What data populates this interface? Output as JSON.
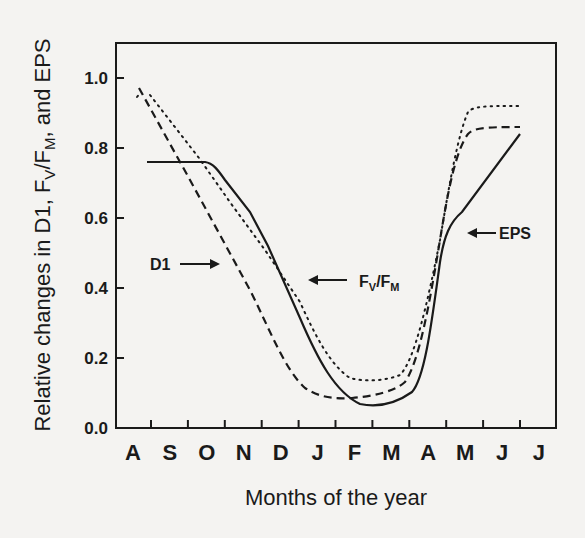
{
  "chart_data": {
    "type": "line",
    "title": "",
    "xlabel": "Months of the year",
    "ylabel": "Relative changes in D1, FV/FM, and EPS",
    "ylabel_parts": {
      "pre": "Relative changes in D1, F",
      "sub1": "V",
      "mid": "/F",
      "sub2": "M",
      "post": ", and EPS"
    },
    "x_categories": [
      "A",
      "S",
      "O",
      "N",
      "D",
      "J",
      "F",
      "M",
      "A",
      "M",
      "J",
      "J"
    ],
    "y_ticks": [
      "0.0",
      "0.2",
      "0.4",
      "0.6",
      "0.8",
      "1.0"
    ],
    "ylim": [
      0.0,
      1.1
    ],
    "grid": false,
    "legend": "inline arrow annotations",
    "series": [
      {
        "name": "D1",
        "style": "dashed",
        "x": [
          "A",
          "S",
          "O",
          "N",
          "D",
          "J",
          "F",
          "M",
          "A",
          "M",
          "J",
          "J"
        ],
        "values": [
          0.96,
          0.84,
          0.69,
          0.52,
          0.36,
          0.18,
          0.1,
          0.09,
          0.1,
          0.55,
          0.84,
          0.86
        ]
      },
      {
        "name": "FV/FM",
        "style": "dotted",
        "x": [
          "A",
          "S",
          "O",
          "N",
          "D",
          "J",
          "F",
          "M",
          "A",
          "M",
          "J",
          "J"
        ],
        "values": [
          0.95,
          0.88,
          0.76,
          0.62,
          0.49,
          0.34,
          0.17,
          0.14,
          0.15,
          0.62,
          0.92,
          0.92
        ]
      },
      {
        "name": "EPS",
        "style": "solid",
        "x": [
          "A",
          "S",
          "O",
          "N",
          "D",
          "J",
          "F",
          "M",
          "A",
          "M",
          "J",
          "J"
        ],
        "values": [
          0.76,
          0.76,
          0.75,
          0.58,
          0.4,
          0.2,
          0.09,
          0.07,
          0.09,
          0.58,
          0.72,
          0.84
        ]
      }
    ],
    "annotations": [
      {
        "label": "D1",
        "arrow": "right"
      },
      {
        "label": "FV/FM",
        "arrow": "left"
      },
      {
        "label": "EPS",
        "arrow": "left"
      }
    ]
  },
  "annotations": {
    "d1": "D1",
    "fvfm_f1": "F",
    "fvfm_v": "V",
    "fvfm_slash": "/F",
    "fvfm_m": "M",
    "eps": "EPS"
  }
}
